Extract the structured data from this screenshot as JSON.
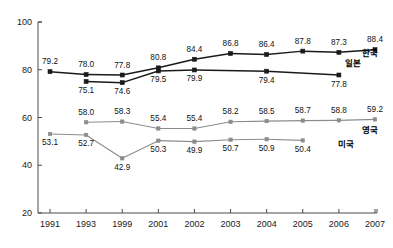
{
  "chart_data": {
    "type": "line",
    "title": "",
    "xlabel": "",
    "ylabel": "",
    "categories": [
      "1991",
      "1993",
      "1999",
      "2001",
      "2002",
      "2003",
      "2004",
      "2005",
      "2006",
      "2007"
    ],
    "ylim": [
      20,
      100
    ],
    "yticks": [
      20,
      40,
      60,
      80,
      100
    ],
    "grid": false,
    "legend_position": "right-inline",
    "series": [
      {
        "name": "한국",
        "color": "#1a1a1a",
        "marker": "square",
        "values": [
          79.2,
          78.0,
          77.8,
          80.8,
          84.4,
          86.8,
          86.4,
          87.8,
          87.3,
          88.4
        ],
        "labels": [
          "79.2",
          "78.0",
          "77.8",
          "80.8",
          "84.4",
          "86.8",
          "86.4",
          "87.8",
          "87.3",
          "88.4"
        ],
        "label_side": [
          "above",
          "above",
          "above",
          "above",
          "above",
          "above",
          "above",
          "above",
          "above",
          "above"
        ]
      },
      {
        "name": "일본",
        "color": "#1a1a1a",
        "marker": "square",
        "values": [
          null,
          75.1,
          74.6,
          79.5,
          79.9,
          null,
          79.4,
          null,
          77.8,
          null
        ],
        "labels": [
          "",
          "75.1",
          "74.6",
          "79.5",
          "79.9",
          "",
          "79.4",
          "",
          "77.8",
          ""
        ],
        "label_side": [
          "below",
          "below",
          "below",
          "below",
          "below",
          "below",
          "below",
          "below",
          "below",
          "below"
        ]
      },
      {
        "name": "영국",
        "color": "#8c8c8c",
        "marker": "square",
        "values": [
          null,
          58.0,
          58.3,
          55.4,
          55.4,
          58.2,
          58.5,
          58.7,
          58.8,
          59.2
        ],
        "labels": [
          "",
          "58.0",
          "58.3",
          "55.4",
          "55.4",
          "58.2",
          "58.5",
          "58.7",
          "58.8",
          "59.2"
        ],
        "label_side": [
          "above",
          "above",
          "above",
          "above",
          "above",
          "above",
          "above",
          "above",
          "above",
          "above"
        ]
      },
      {
        "name": "미국",
        "color": "#8c8c8c",
        "marker": "square",
        "values": [
          53.1,
          52.7,
          42.9,
          50.3,
          49.9,
          50.7,
          50.9,
          50.4,
          null,
          null
        ],
        "labels": [
          "53.1",
          "52.7",
          "42.9",
          "50.3",
          "49.9",
          "50.7",
          "50.9",
          "50.4",
          "",
          ""
        ],
        "label_side": [
          "below",
          "below",
          "below",
          "below",
          "below",
          "below",
          "below",
          "below",
          "below",
          "below"
        ]
      }
    ],
    "series_labels": [
      {
        "name": "한국",
        "x": 362,
        "y": 56
      },
      {
        "name": "일본",
        "x": 345,
        "y": 66
      },
      {
        "name": "영국",
        "x": 362,
        "y": 133
      },
      {
        "name": "미국",
        "x": 338,
        "y": 147
      }
    ],
    "colors": {
      "dark_series": "#1a1a1a",
      "light_series": "#8c8c8c",
      "axis": "#4a4a4a",
      "background": "#ffffff",
      "text": "#111111"
    }
  }
}
